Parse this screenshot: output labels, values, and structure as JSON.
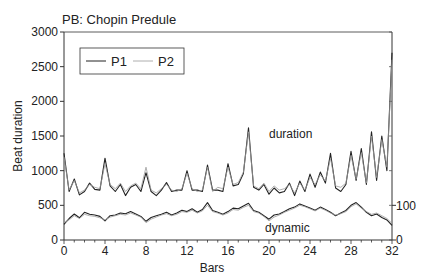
{
  "chart_data": {
    "type": "line",
    "title": "PB: Chopin Predule",
    "xlabel": "Bars",
    "ylabel": "Beat duration",
    "xlim": [
      0,
      32
    ],
    "ylim": [
      0,
      3000
    ],
    "x_ticks": [
      0,
      4,
      8,
      12,
      16,
      20,
      24,
      28,
      32
    ],
    "y_ticks": [
      0,
      500,
      1000,
      1500,
      2000,
      2500,
      3000
    ],
    "right_axis": {
      "ticks": [
        0,
        100
      ],
      "ylim_equiv": [
        0,
        100
      ],
      "note": "dynamic scale: 0 at bottom, 100 at y=500 level"
    },
    "grid": false,
    "legend": {
      "position": "upper-left",
      "entries": [
        "P1",
        "P2"
      ]
    },
    "annotations": [
      {
        "text": "duration",
        "x": 21.5,
        "y": 1200
      },
      {
        "text": "dynamic",
        "x": 20.5,
        "y": 170
      }
    ],
    "series": [
      {
        "name": "P1",
        "group": "duration",
        "style": "solid-dark",
        "x": [
          0,
          0.5,
          1,
          1.5,
          2,
          2.5,
          3,
          3.5,
          4,
          4.5,
          5,
          5.5,
          6,
          6.5,
          7,
          7.5,
          8,
          8.5,
          9,
          9.5,
          10,
          10.5,
          11,
          11.5,
          12,
          12.5,
          13,
          13.5,
          14,
          14.5,
          15,
          15.5,
          16,
          16.5,
          17,
          17.5,
          18,
          18.5,
          19,
          19.5,
          20,
          20.5,
          21,
          21.5,
          22,
          22.5,
          23,
          23.5,
          24,
          24.5,
          25,
          25.5,
          26,
          26.5,
          27,
          27.5,
          28,
          28.5,
          29,
          29.5,
          30,
          30.5,
          31,
          31.5,
          32
        ],
        "y": [
          1250,
          700,
          880,
          650,
          700,
          820,
          730,
          720,
          1180,
          780,
          700,
          800,
          640,
          760,
          800,
          700,
          970,
          700,
          640,
          720,
          830,
          700,
          720,
          720,
          1000,
          720,
          720,
          700,
          1080,
          720,
          720,
          700,
          1100,
          780,
          800,
          960,
          1620,
          760,
          720,
          800,
          660,
          750,
          680,
          700,
          820,
          640,
          850,
          700,
          950,
          760,
          980,
          820,
          1250,
          750,
          700,
          800,
          1280,
          860,
          1320,
          800,
          1560,
          860,
          1500,
          1000,
          2700
        ]
      },
      {
        "name": "P2",
        "group": "duration",
        "style": "solid-light",
        "x": [
          0,
          0.5,
          1,
          1.5,
          2,
          2.5,
          3,
          3.5,
          4,
          4.5,
          5,
          5.5,
          6,
          6.5,
          7,
          7.5,
          8,
          8.5,
          9,
          9.5,
          10,
          10.5,
          11,
          11.5,
          12,
          12.5,
          13,
          13.5,
          14,
          14.5,
          15,
          15.5,
          16,
          16.5,
          17,
          17.5,
          18,
          18.5,
          19,
          19.5,
          20,
          20.5,
          21,
          21.5,
          22,
          22.5,
          23,
          23.5,
          24,
          24.5,
          25,
          25.5,
          26,
          26.5,
          27,
          27.5,
          28,
          28.5,
          29,
          29.5,
          30,
          30.5,
          31,
          31.5,
          32
        ],
        "y": [
          1200,
          720,
          860,
          680,
          720,
          800,
          760,
          740,
          1100,
          800,
          740,
          820,
          700,
          780,
          820,
          740,
          1050,
          720,
          680,
          740,
          800,
          720,
          700,
          740,
          960,
          740,
          700,
          720,
          1050,
          700,
          760,
          740,
          1050,
          800,
          830,
          980,
          1560,
          780,
          740,
          820,
          700,
          780,
          720,
          740,
          800,
          680,
          820,
          720,
          900,
          800,
          940,
          850,
          1180,
          780,
          760,
          820,
          1220,
          880,
          1260,
          820,
          1500,
          900,
          1450,
          1050,
          2600
        ]
      },
      {
        "name": "P1",
        "group": "dynamic",
        "style": "solid-dark",
        "unit": "right-axis 0-100",
        "x": [
          0,
          0.5,
          1,
          1.5,
          2,
          2.5,
          3,
          3.5,
          4,
          4.5,
          5,
          5.5,
          6,
          6.5,
          7,
          7.5,
          8,
          8.5,
          9,
          9.5,
          10,
          10.5,
          11,
          11.5,
          12,
          12.5,
          13,
          13.5,
          14,
          14.5,
          15,
          15.5,
          16,
          16.5,
          17,
          17.5,
          18,
          18.5,
          19,
          19.5,
          20,
          20.5,
          21,
          21.5,
          22,
          22.5,
          23,
          23.5,
          24,
          24.5,
          25,
          25.5,
          26,
          26.5,
          27,
          27.5,
          28,
          28.5,
          29,
          29.5,
          30,
          30.5,
          31,
          31.5,
          32
        ],
        "y": [
          45,
          62,
          75,
          64,
          80,
          74,
          72,
          68,
          55,
          70,
          72,
          78,
          76,
          82,
          75,
          68,
          54,
          65,
          70,
          74,
          80,
          72,
          78,
          86,
          82,
          90,
          80,
          88,
          108,
          85,
          80,
          74,
          82,
          92,
          90,
          98,
          106,
          85,
          80,
          70,
          60,
          72,
          75,
          82,
          90,
          95,
          104,
          98,
          92,
          86,
          95,
          88,
          80,
          70,
          78,
          85,
          100,
          108,
          95,
          80,
          70,
          75,
          65,
          58,
          42
        ]
      },
      {
        "name": "P2",
        "group": "dynamic",
        "style": "solid-light",
        "unit": "right-axis 0-100",
        "x": [
          0,
          0.5,
          1,
          1.5,
          2,
          2.5,
          3,
          3.5,
          4,
          4.5,
          5,
          5.5,
          6,
          6.5,
          7,
          7.5,
          8,
          8.5,
          9,
          9.5,
          10,
          10.5,
          11,
          11.5,
          12,
          12.5,
          13,
          13.5,
          14,
          14.5,
          15,
          15.5,
          16,
          16.5,
          17,
          17.5,
          18,
          18.5,
          19,
          19.5,
          20,
          20.5,
          21,
          21.5,
          22,
          22.5,
          23,
          23.5,
          24,
          24.5,
          25,
          25.5,
          26,
          26.5,
          27,
          27.5,
          28,
          28.5,
          29,
          29.5,
          30,
          30.5,
          31,
          31.5,
          32
        ],
        "y": [
          50,
          58,
          70,
          62,
          74,
          70,
          68,
          64,
          58,
          66,
          70,
          74,
          72,
          78,
          72,
          66,
          50,
          60,
          66,
          72,
          76,
          70,
          74,
          82,
          80,
          86,
          78,
          84,
          100,
          82,
          78,
          72,
          78,
          88,
          86,
          94,
          100,
          82,
          78,
          68,
          55,
          66,
          72,
          80,
          86,
          92,
          100,
          96,
          90,
          84,
          92,
          86,
          78,
          72,
          76,
          82,
          96,
          104,
          92,
          82,
          74,
          78,
          70,
          62,
          48
        ]
      }
    ]
  },
  "labels": {
    "title": "PB: Chopin Predule",
    "xlabel": "Bars",
    "ylabel": "Beat duration",
    "duration_label": "duration",
    "dynamic_label": "dynamic",
    "legend_p1": "P1",
    "legend_p2": "P2",
    "right_tick_0": "0",
    "right_tick_100": "100"
  }
}
